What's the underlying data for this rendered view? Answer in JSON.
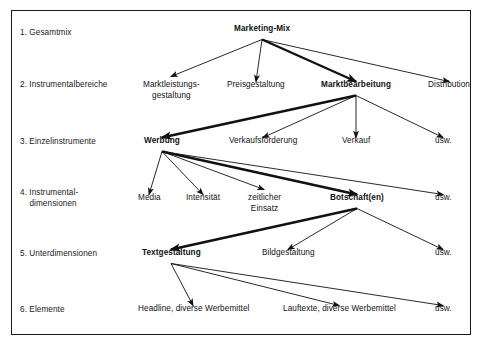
{
  "diagram": {
    "frame_color": "#1a1a1a",
    "background": "#ffffff",
    "text_color": "#111111",
    "rows": [
      {
        "id": "row-1",
        "label": "1. Gesamtmix"
      },
      {
        "id": "row-2",
        "label": "2. Instrumentalbereiche"
      },
      {
        "id": "row-3",
        "label": "3. Einzelinstrumente"
      },
      {
        "id": "row-4",
        "label": "4. Instrumental-\n    dimensionen"
      },
      {
        "id": "row-5",
        "label": "5. Unterdimensionen"
      },
      {
        "id": "row-6",
        "label": "6. Elemente"
      }
    ],
    "nodes": [
      {
        "id": "marketing-mix",
        "label": "Marketing-Mix",
        "level": 1,
        "bold": true,
        "cx": 262,
        "cy": 33
      },
      {
        "id": "marktleistung",
        "label": "Marktleistungs-\ngestaltung",
        "level": 2,
        "bold": false,
        "cx": 171,
        "cy": 89
      },
      {
        "id": "preisgestaltung",
        "label": "Preisgestaltung",
        "level": 2,
        "bold": false,
        "cx": 256,
        "cy": 89
      },
      {
        "id": "marktbearbeitung",
        "label": "Marktbearbeitung",
        "level": 2,
        "bold": true,
        "cx": 356,
        "cy": 89
      },
      {
        "id": "distribution",
        "label": "Distribution",
        "level": 2,
        "bold": false,
        "cx": 449,
        "cy": 89
      },
      {
        "id": "werbung",
        "label": "Werbung",
        "level": 3,
        "bold": true,
        "cx": 162,
        "cy": 145
      },
      {
        "id": "verkaufsfoerderung",
        "label": "Verkaufsförderung",
        "level": 3,
        "bold": false,
        "cx": 263,
        "cy": 145
      },
      {
        "id": "verkauf",
        "label": "Verkauf",
        "level": 3,
        "bold": false,
        "cx": 356,
        "cy": 145
      },
      {
        "id": "usw-3",
        "label": "usw.",
        "level": 3,
        "bold": false,
        "cx": 443,
        "cy": 145
      },
      {
        "id": "media",
        "label": "Media",
        "level": 4,
        "bold": false,
        "cx": 149,
        "cy": 202
      },
      {
        "id": "intensitaet",
        "label": "Intensität",
        "level": 4,
        "bold": false,
        "cx": 203,
        "cy": 202
      },
      {
        "id": "zeitlicher-einsatz",
        "label": "zeitlicher\nEinsatz",
        "level": 4,
        "bold": false,
        "cx": 264,
        "cy": 202
      },
      {
        "id": "botschaften",
        "label": "Botschaft(en)",
        "level": 4,
        "bold": true,
        "cx": 357,
        "cy": 202
      },
      {
        "id": "usw-4",
        "label": "usw.",
        "level": 4,
        "bold": false,
        "cx": 443,
        "cy": 202
      },
      {
        "id": "textgestaltung",
        "label": "Textgestaltung",
        "level": 5,
        "bold": true,
        "cx": 171,
        "cy": 257
      },
      {
        "id": "bildgestaltung",
        "label": "Bildgestaltung",
        "level": 5,
        "bold": false,
        "cx": 288,
        "cy": 257
      },
      {
        "id": "usw-5",
        "label": "usw.",
        "level": 5,
        "bold": false,
        "cx": 443,
        "cy": 257
      },
      {
        "id": "headline-werbemittel",
        "label": "Headline, diverse Werbemittel",
        "level": 6,
        "bold": false,
        "cx": 193,
        "cy": 313
      },
      {
        "id": "lauftexte-werbemittel",
        "label": "Lauftexte, diverse Werbemittel",
        "level": 6,
        "bold": false,
        "cx": 339,
        "cy": 313
      },
      {
        "id": "usw-6",
        "label": "usw.",
        "level": 6,
        "bold": false,
        "cx": 443,
        "cy": 313
      }
    ],
    "edges": [
      {
        "id": "edge-mm-marktleistung",
        "from": "marketing-mix",
        "to": "marktleistung",
        "emphasis": "thin"
      },
      {
        "id": "edge-mm-preis",
        "from": "marketing-mix",
        "to": "preisgestaltung",
        "emphasis": "thin"
      },
      {
        "id": "edge-mm-marktbearbeitung",
        "from": "marketing-mix",
        "to": "marktbearbeitung",
        "emphasis": "thick"
      },
      {
        "id": "edge-mm-distribution",
        "from": "marketing-mix",
        "to": "distribution",
        "emphasis": "thin"
      },
      {
        "id": "edge-mb-werbung",
        "from": "marktbearbeitung",
        "to": "werbung",
        "emphasis": "thick"
      },
      {
        "id": "edge-mb-vkf",
        "from": "marktbearbeitung",
        "to": "verkaufsfoerderung",
        "emphasis": "thin"
      },
      {
        "id": "edge-mb-verkauf",
        "from": "marktbearbeitung",
        "to": "verkauf",
        "emphasis": "thin"
      },
      {
        "id": "edge-mb-usw",
        "from": "marktbearbeitung",
        "to": "usw-3",
        "emphasis": "thin"
      },
      {
        "id": "edge-we-media",
        "from": "werbung",
        "to": "media",
        "emphasis": "thin"
      },
      {
        "id": "edge-we-intensitaet",
        "from": "werbung",
        "to": "intensitaet",
        "emphasis": "thin"
      },
      {
        "id": "edge-we-zeitlich",
        "from": "werbung",
        "to": "zeitlicher-einsatz",
        "emphasis": "thin"
      },
      {
        "id": "edge-we-botschaften",
        "from": "werbung",
        "to": "botschaften",
        "emphasis": "thick"
      },
      {
        "id": "edge-we-usw",
        "from": "werbung",
        "to": "usw-4",
        "emphasis": "thin"
      },
      {
        "id": "edge-bo-text",
        "from": "botschaften",
        "to": "textgestaltung",
        "emphasis": "thick"
      },
      {
        "id": "edge-bo-bild",
        "from": "botschaften",
        "to": "bildgestaltung",
        "emphasis": "thin"
      },
      {
        "id": "edge-bo-usw",
        "from": "botschaften",
        "to": "usw-5",
        "emphasis": "thin"
      },
      {
        "id": "edge-tg-headline",
        "from": "textgestaltung",
        "to": "headline-werbemittel",
        "emphasis": "thin"
      },
      {
        "id": "edge-tg-lauftexte",
        "from": "textgestaltung",
        "to": "lauftexte-werbemittel",
        "emphasis": "thin"
      },
      {
        "id": "edge-tg-usw",
        "from": "textgestaltung",
        "to": "usw-6",
        "emphasis": "thin"
      }
    ],
    "row_label_positions": [
      36,
      88,
      145,
      196,
      257,
      313
    ],
    "row_label_x": 20
  }
}
